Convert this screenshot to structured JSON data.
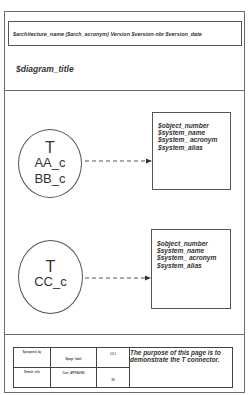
{
  "header": {
    "architecture_line": "$architecture_name  ($arch_acronym) Version $version-nbr $version_date"
  },
  "diagram": {
    "title": "$diagram_title",
    "connectors": [
      {
        "symbol": "T",
        "components": [
          "AA_c",
          "BB_c"
        ]
      },
      {
        "symbol": "T",
        "components": [
          "CC_c"
        ]
      }
    ],
    "objects": [
      {
        "lines": [
          "$object_number",
          "$system_name",
          "$system_ acronym",
          "$system_alias"
        ]
      },
      {
        "lines": [
          "$object_number",
          "$system_name",
          "$system_ acronym",
          "$system_alias"
        ]
      }
    ],
    "arrow_style": "dashed",
    "line_color": "#555555"
  },
  "footer": {
    "prepared_by": "$prepared_by",
    "page_label": "$page_label",
    "version": "1.0.1",
    "reach_info": "$reach_info",
    "core_code": "Core_APP/A0/E0",
    "page_number": "00",
    "description": "The purpose of this page is to demonstrate the T connector."
  }
}
